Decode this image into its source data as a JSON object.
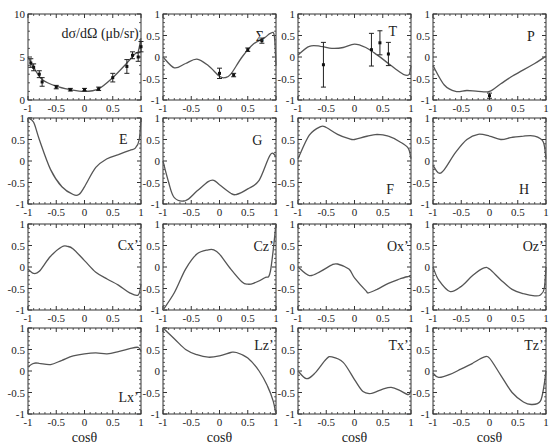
{
  "figure": {
    "rows": 4,
    "cols": 4,
    "shared_xlabel": "cosθ"
  },
  "chart_data": [
    {
      "id": "dsigma",
      "type": "line",
      "label": "dσ/dΩ (μb/sr)",
      "xlim": [
        -1,
        1
      ],
      "ylim": [
        0,
        10
      ],
      "xticks": [
        "-1",
        "-0.5",
        "0",
        "0.5",
        "1"
      ],
      "yticks": [
        "0",
        "5",
        "10"
      ],
      "curve": {
        "x": [
          -1,
          -0.9,
          -0.75,
          -0.5,
          -0.25,
          0,
          0.25,
          0.5,
          0.75,
          0.9,
          0.95,
          1
        ],
        "y": [
          5.0,
          3.8,
          2.4,
          1.6,
          1.2,
          1.0,
          1.3,
          2.6,
          4.3,
          5.4,
          5.6,
          7.2
        ]
      },
      "points": [
        {
          "x": -0.95,
          "y": 4.3,
          "err": 0.5
        },
        {
          "x": -0.9,
          "y": 3.8,
          "err": 0.4
        },
        {
          "x": -0.8,
          "y": 3.0,
          "err": 0.4
        },
        {
          "x": -0.75,
          "y": 2.1,
          "err": 0.5
        },
        {
          "x": -0.5,
          "y": 1.5,
          "err": 0.2
        },
        {
          "x": -0.25,
          "y": 1.2,
          "err": 0.15
        },
        {
          "x": 0.0,
          "y": 1.2,
          "err": 0.15
        },
        {
          "x": 0.25,
          "y": 1.3,
          "err": 0.2
        },
        {
          "x": 0.5,
          "y": 2.6,
          "err": 0.5
        },
        {
          "x": 0.75,
          "y": 3.9,
          "err": 0.8
        },
        {
          "x": 0.85,
          "y": 5.2,
          "err": 0.4
        },
        {
          "x": 0.95,
          "y": 5.0,
          "err": 0.5
        },
        {
          "x": 1.0,
          "y": 6.2,
          "err": 0.6
        }
      ]
    },
    {
      "id": "Sigma",
      "type": "line",
      "label": "Σ",
      "xlim": [
        -1,
        1
      ],
      "ylim": [
        -1,
        1
      ],
      "xticks": [
        "-1",
        "-0.5",
        "0",
        "0.5",
        "1"
      ],
      "yticks": [
        "-1",
        "-0.5",
        "0",
        "0.5",
        "1"
      ],
      "curve": {
        "x": [
          -1,
          -0.8,
          -0.6,
          -0.4,
          -0.2,
          0,
          0.1,
          0.2,
          0.4,
          0.6,
          0.8,
          0.9,
          0.97,
          1
        ],
        "y": [
          0.0,
          -0.25,
          -0.15,
          -0.05,
          -0.2,
          -0.45,
          -0.48,
          -0.4,
          0.0,
          0.3,
          0.45,
          0.55,
          0.5,
          -0.2
        ]
      },
      "points": [
        {
          "x": 0.0,
          "y": -0.38,
          "err": 0.12
        },
        {
          "x": 0.25,
          "y": -0.42,
          "err": 0.04
        },
        {
          "x": 0.5,
          "y": 0.17,
          "err": 0.04
        },
        {
          "x": 0.75,
          "y": 0.38,
          "err": 0.06
        }
      ]
    },
    {
      "id": "T",
      "type": "line",
      "label": "T",
      "xlim": [
        -1,
        1
      ],
      "ylim": [
        -1,
        1
      ],
      "xticks": [
        "-1",
        "-0.5",
        "0",
        "0.5",
        "1"
      ],
      "yticks": [
        "-1",
        "-0.5",
        "0",
        "0.5",
        "1"
      ],
      "curve": {
        "x": [
          -1,
          -0.8,
          -0.6,
          -0.4,
          -0.2,
          0,
          0.2,
          0.4,
          0.6,
          0.8,
          0.9,
          0.97,
          1
        ],
        "y": [
          0.05,
          0.25,
          0.25,
          0.2,
          0.22,
          0.3,
          0.22,
          0.05,
          -0.15,
          -0.35,
          -0.42,
          -0.4,
          -0.2
        ]
      },
      "points": [
        {
          "x": -0.55,
          "y": -0.18,
          "err": 0.52
        },
        {
          "x": 0.3,
          "y": 0.17,
          "err": 0.38
        },
        {
          "x": 0.45,
          "y": 0.33,
          "err": 0.28
        },
        {
          "x": 0.6,
          "y": 0.07,
          "err": 0.27
        }
      ]
    },
    {
      "id": "P",
      "type": "line",
      "label": "P",
      "xlim": [
        -1,
        1
      ],
      "ylim": [
        -1,
        1
      ],
      "xticks": [
        "-1",
        "-0.5",
        "0",
        "0.5",
        "1"
      ],
      "yticks": [
        "-1",
        "-0.5",
        "0",
        "0.5",
        "1"
      ],
      "curve": {
        "x": [
          -1,
          -0.8,
          -0.6,
          -0.4,
          -0.2,
          0,
          0.2,
          0.4,
          0.6,
          0.8,
          1
        ],
        "y": [
          -0.2,
          -0.65,
          -0.8,
          -0.78,
          -0.8,
          -0.8,
          -0.62,
          -0.45,
          -0.3,
          -0.15,
          0.02
        ]
      },
      "points": [
        {
          "x": 0.0,
          "y": -0.9,
          "err": 0.06
        }
      ]
    },
    {
      "id": "E",
      "type": "line",
      "label": "E",
      "xlim": [
        -1,
        1
      ],
      "ylim": [
        -1,
        1
      ],
      "xticks": [
        "-1",
        "-0.5",
        "0",
        "0.5",
        "1"
      ],
      "yticks": [
        "-1",
        "-0.5",
        "0",
        "0.5",
        "1"
      ],
      "curve": {
        "x": [
          -1,
          -0.9,
          -0.8,
          -0.6,
          -0.4,
          -0.2,
          -0.1,
          0,
          0.2,
          0.4,
          0.6,
          0.8,
          0.9,
          0.97,
          1
        ],
        "y": [
          1.0,
          0.9,
          0.5,
          -0.2,
          -0.6,
          -0.78,
          -0.78,
          -0.6,
          -0.15,
          0.05,
          0.15,
          0.25,
          0.3,
          0.5,
          1.0
        ]
      }
    },
    {
      "id": "G",
      "type": "line",
      "label": "G",
      "xlim": [
        -1,
        1
      ],
      "ylim": [
        -1,
        1
      ],
      "xticks": [
        "-1",
        "-0.5",
        "0",
        "0.5",
        "1"
      ],
      "yticks": [
        "-1",
        "-0.5",
        "0",
        "0.5",
        "1"
      ],
      "curve": {
        "x": [
          -1,
          -0.9,
          -0.8,
          -0.6,
          -0.4,
          -0.2,
          -0.1,
          0,
          0.2,
          0.3,
          0.5,
          0.7,
          0.9,
          1
        ],
        "y": [
          0.0,
          -0.5,
          -0.85,
          -0.92,
          -0.7,
          -0.48,
          -0.45,
          -0.55,
          -0.75,
          -0.78,
          -0.65,
          -0.45,
          0.15,
          0.1
        ]
      }
    },
    {
      "id": "F",
      "type": "line",
      "label": "F",
      "xlim": [
        -1,
        1
      ],
      "ylim": [
        -1,
        1
      ],
      "xticks": [
        "-1",
        "-0.5",
        "0",
        "0.5",
        "1"
      ],
      "yticks": [
        "-1",
        "-0.5",
        "0",
        "0.5",
        "1"
      ],
      "curve": {
        "x": [
          -1,
          -0.8,
          -0.6,
          -0.5,
          -0.3,
          -0.1,
          0,
          0.2,
          0.4,
          0.6,
          0.8,
          0.95,
          1
        ],
        "y": [
          0.05,
          0.6,
          0.8,
          0.78,
          0.62,
          0.52,
          0.5,
          0.57,
          0.62,
          0.58,
          0.45,
          0.3,
          0.05
        ]
      }
    },
    {
      "id": "H",
      "type": "line",
      "label": "H",
      "xlim": [
        -1,
        1
      ],
      "ylim": [
        -1,
        1
      ],
      "xticks": [
        "-1",
        "-0.5",
        "0",
        "0.5",
        "1"
      ],
      "yticks": [
        "-1",
        "-0.5",
        "0",
        "0.5",
        "1"
      ],
      "curve": {
        "x": [
          -1,
          -0.9,
          -0.8,
          -0.6,
          -0.4,
          -0.2,
          0,
          0.2,
          0.4,
          0.6,
          0.8,
          0.95,
          1
        ],
        "y": [
          -0.1,
          -0.28,
          -0.2,
          0.2,
          0.5,
          0.62,
          0.58,
          0.5,
          0.55,
          0.58,
          0.58,
          0.45,
          0.05
        ]
      }
    },
    {
      "id": "Cx",
      "type": "line",
      "label": "Cx’",
      "xlim": [
        -1,
        1
      ],
      "ylim": [
        -1,
        1
      ],
      "xticks": [
        "-1",
        "-0.5",
        "0",
        "0.5",
        "1"
      ],
      "yticks": [
        "-1",
        "-0.5",
        "0",
        "0.5",
        "1"
      ],
      "curve": {
        "x": [
          -1,
          -0.9,
          -0.8,
          -0.6,
          -0.4,
          -0.3,
          -0.2,
          0,
          0.2,
          0.4,
          0.6,
          0.8,
          0.95,
          1
        ],
        "y": [
          -0.05,
          -0.15,
          -0.1,
          0.25,
          0.47,
          0.48,
          0.42,
          0.15,
          -0.12,
          -0.28,
          -0.42,
          -0.6,
          -0.65,
          -0.4
        ]
      }
    },
    {
      "id": "Cz",
      "type": "line",
      "label": "Cz’",
      "xlim": [
        -1,
        1
      ],
      "ylim": [
        -1,
        1
      ],
      "xticks": [
        "-1",
        "-0.5",
        "0",
        "0.5",
        "1"
      ],
      "yticks": [
        "-1",
        "-0.5",
        "0",
        "0.5",
        "1"
      ],
      "curve": {
        "x": [
          -1,
          -0.8,
          -0.6,
          -0.4,
          -0.2,
          -0.1,
          0,
          0.2,
          0.4,
          0.5,
          0.6,
          0.8,
          0.9,
          1
        ],
        "y": [
          -1.0,
          -0.6,
          -0.05,
          0.3,
          0.4,
          0.4,
          0.3,
          -0.05,
          -0.35,
          -0.4,
          -0.38,
          -0.25,
          -0.1,
          1.0
        ]
      }
    },
    {
      "id": "Ox",
      "type": "line",
      "label": "Ox’",
      "xlim": [
        -1,
        1
      ],
      "ylim": [
        -1,
        1
      ],
      "xticks": [
        "-1",
        "-0.5",
        "0",
        "0.5",
        "1"
      ],
      "yticks": [
        "-1",
        "-0.5",
        "0",
        "0.5",
        "1"
      ],
      "curve": {
        "x": [
          -1,
          -0.8,
          -0.6,
          -0.4,
          -0.3,
          -0.1,
          0,
          0.2,
          0.25,
          0.4,
          0.6,
          0.8,
          0.95,
          1
        ],
        "y": [
          0.0,
          -0.2,
          -0.1,
          0.05,
          0.07,
          -0.05,
          -0.25,
          -0.55,
          -0.6,
          -0.52,
          -0.38,
          -0.28,
          -0.22,
          -0.25
        ]
      }
    },
    {
      "id": "Oz",
      "type": "line",
      "label": "Oz’",
      "xlim": [
        -1,
        1
      ],
      "ylim": [
        -1,
        1
      ],
      "xticks": [
        "-1",
        "-0.5",
        "0",
        "0.5",
        "1"
      ],
      "yticks": [
        "-1",
        "-0.5",
        "0",
        "0.5",
        "1"
      ],
      "curve": {
        "x": [
          -1,
          -0.9,
          -0.7,
          -0.5,
          -0.3,
          -0.1,
          0,
          0.2,
          0.4,
          0.6,
          0.8,
          0.9,
          0.97,
          1
        ],
        "y": [
          0.0,
          -0.3,
          -0.57,
          -0.45,
          -0.2,
          -0.02,
          -0.05,
          -0.3,
          -0.52,
          -0.62,
          -0.67,
          -0.65,
          -0.5,
          0.0
        ]
      }
    },
    {
      "id": "Lx",
      "type": "line",
      "label": "Lx’",
      "xlim": [
        -1,
        1
      ],
      "ylim": [
        -1,
        1
      ],
      "xticks": [
        "-1",
        "-0.5",
        "0",
        "0.5",
        "1"
      ],
      "yticks": [
        "-1",
        "-0.5",
        "0",
        "0.5",
        "1"
      ],
      "curve": {
        "x": [
          -1,
          -0.9,
          -0.8,
          -0.6,
          -0.4,
          -0.2,
          0,
          0.2,
          0.4,
          0.6,
          0.8,
          0.95,
          1
        ],
        "y": [
          0.1,
          0.18,
          0.18,
          0.15,
          0.25,
          0.35,
          0.4,
          0.42,
          0.4,
          0.45,
          0.52,
          0.55,
          0.45
        ]
      }
    },
    {
      "id": "Lz",
      "type": "line",
      "label": "Lz’",
      "xlim": [
        -1,
        1
      ],
      "ylim": [
        -1,
        1
      ],
      "xticks": [
        "-1",
        "-0.5",
        "0",
        "0.5",
        "1"
      ],
      "yticks": [
        "-1",
        "-0.5",
        "0",
        "0.5",
        "1"
      ],
      "curve": {
        "x": [
          -1,
          -0.8,
          -0.6,
          -0.4,
          -0.2,
          0,
          0.2,
          0.3,
          0.5,
          0.7,
          0.85,
          0.95,
          1
        ],
        "y": [
          1.0,
          0.75,
          0.5,
          0.38,
          0.32,
          0.35,
          0.43,
          0.43,
          0.3,
          0.0,
          -0.35,
          -0.7,
          -1.0
        ]
      }
    },
    {
      "id": "Tx",
      "type": "line",
      "label": "Tx’",
      "xlim": [
        -1,
        1
      ],
      "ylim": [
        -1,
        1
      ],
      "xticks": [
        "-1",
        "-0.5",
        "0",
        "0.5",
        "1"
      ],
      "yticks": [
        "-1",
        "-0.5",
        "0",
        "0.5",
        "1"
      ],
      "curve": {
        "x": [
          -1,
          -0.85,
          -0.7,
          -0.5,
          -0.4,
          -0.2,
          0,
          0.15,
          0.3,
          0.5,
          0.65,
          0.8,
          0.95,
          1
        ],
        "y": [
          0.0,
          -0.18,
          -0.05,
          0.28,
          0.33,
          0.2,
          -0.2,
          -0.48,
          -0.52,
          -0.42,
          -0.38,
          -0.45,
          -0.55,
          -0.45
        ]
      }
    },
    {
      "id": "Tz",
      "type": "line",
      "label": "Tz’",
      "xlim": [
        -1,
        1
      ],
      "ylim": [
        -1,
        1
      ],
      "xticks": [
        "-1",
        "-0.5",
        "0",
        "0.5",
        "1"
      ],
      "yticks": [
        "-1",
        "-0.5",
        "0",
        "0.5",
        "1"
      ],
      "curve": {
        "x": [
          -1,
          -0.9,
          -0.7,
          -0.5,
          -0.3,
          -0.1,
          0,
          0.2,
          0.4,
          0.6,
          0.75,
          0.9,
          0.97,
          1
        ],
        "y": [
          -0.05,
          -0.15,
          -0.08,
          0.05,
          0.18,
          0.32,
          0.3,
          -0.1,
          -0.5,
          -0.72,
          -0.78,
          -0.7,
          -0.3,
          0.0
        ]
      }
    }
  ]
}
